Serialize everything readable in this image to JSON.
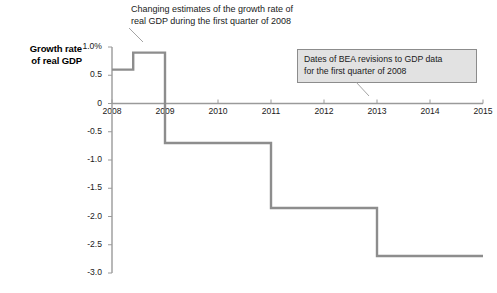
{
  "figure": {
    "axis_title_lines": [
      "Growth rate",
      "of real GDP"
    ],
    "annotations": [
      {
        "name": "top-callout",
        "style": "plain",
        "lines": [
          "Changing estimates of the growth rate of",
          "real GDP during the first quarter of 2008"
        ]
      },
      {
        "name": "boxed-callout",
        "style": "boxed",
        "background": "#e2e2e2",
        "border": "#8c8c8c",
        "lines": [
          "Dates of BEA revisions to GDP data",
          "for the first quarter of 2008"
        ]
      }
    ]
  },
  "chart_data": {
    "type": "line",
    "subtype": "step",
    "title": "",
    "xlabel": "",
    "ylabel": "Growth rate of real GDP",
    "xlim": [
      2008,
      2015
    ],
    "ylim": [
      -3.0,
      1.0
    ],
    "grid": false,
    "legend": null,
    "xticks": [
      2008,
      2009,
      2010,
      2011,
      2012,
      2013,
      2014,
      2015
    ],
    "xticklabels": [
      "2008",
      "2009",
      "2010",
      "2011",
      "2012",
      "2013",
      "2014",
      "2015"
    ],
    "yticks": [
      1.0,
      0.5,
      0,
      -0.5,
      -1.0,
      -1.5,
      -2.0,
      -2.5,
      -3.0
    ],
    "yticklabels": [
      "1.0%",
      "0.5",
      "0",
      "-0.5",
      "-1.0",
      "-1.5",
      "-2.0",
      "-2.5",
      "-3.0"
    ],
    "series": [
      {
        "name": "BEA estimate of 2008 Q1 real GDP growth rate",
        "color": "#8d8d8d",
        "steps": [
          {
            "x_start": 2008.0,
            "x_end": 2008.4,
            "y": 0.6
          },
          {
            "x_start": 2008.4,
            "x_end": 2009.0,
            "y": 0.9
          },
          {
            "x_start": 2009.0,
            "x_end": 2011.0,
            "y": -0.7
          },
          {
            "x_start": 2011.0,
            "x_end": 2013.0,
            "y": -1.85
          },
          {
            "x_start": 2013.0,
            "x_end": 2015.0,
            "y": -2.7
          }
        ]
      }
    ],
    "x": [
      2008.0,
      2008.4,
      2008.4,
      2009.0,
      2009.0,
      2011.0,
      2011.0,
      2013.0,
      2013.0,
      2015.0
    ],
    "y": [
      0.6,
      0.6,
      0.9,
      0.9,
      -0.7,
      -0.7,
      -1.85,
      -1.85,
      -2.7,
      -2.7
    ]
  }
}
